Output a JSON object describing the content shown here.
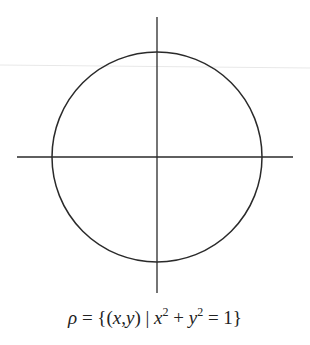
{
  "figure": {
    "type": "unit-circle-diagram",
    "stroke_color": "#2a2a2a",
    "faint_line_color": "#e6e6e6",
    "circle": {
      "cx": 157,
      "cy": 157,
      "r": 105
    },
    "x_axis": {
      "x1": 17,
      "x2": 293,
      "y": 157
    },
    "y_axis": {
      "x": 157,
      "y1": 17,
      "y2": 293
    }
  },
  "caption": {
    "lhs": "ρ",
    "eq": " = {(",
    "x": "x",
    "comma": ",",
    "y": "y",
    "mid": ") | ",
    "x2": "x",
    "exp1": "2",
    "plus": " + ",
    "y2": "y",
    "exp2": "2",
    "rhs": " = 1}",
    "full_text": "ρ = {(x,y) | x² + y² = 1}"
  }
}
